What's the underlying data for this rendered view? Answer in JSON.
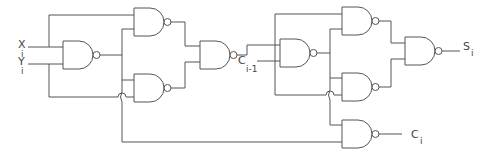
{
  "diagram": {
    "type": "logic-circuit",
    "gate_type": "NAND",
    "gate_count": 9,
    "stroke_color": "#555555",
    "background": "#ffffff"
  },
  "inputs": [
    {
      "main": "X",
      "sub": "i"
    },
    {
      "main": "Y",
      "sub": "i"
    }
  ],
  "intermediate": {
    "main": "C",
    "sub": "i-1"
  },
  "outputs": [
    {
      "main": "S",
      "sub": "i"
    },
    {
      "main": "C",
      "sub": "i"
    }
  ]
}
